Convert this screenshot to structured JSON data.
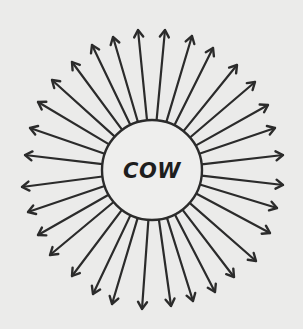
{
  "diagram": {
    "type": "radial-arrows",
    "center_label": "COW",
    "arrow_count": 32,
    "arrow_direction": "outward",
    "colors": {
      "background": "#ebebea",
      "ink": "#2b2b2b",
      "hub_fill": "#eeeeed"
    }
  }
}
